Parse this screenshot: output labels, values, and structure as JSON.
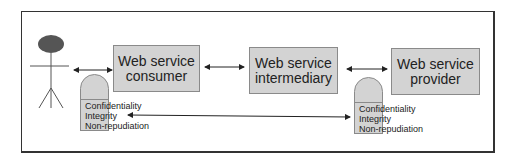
{
  "diagram": {
    "actor": {
      "name": "User"
    },
    "boxes": [
      {
        "id": "consumer",
        "line1": "Web service",
        "line2": "consumer"
      },
      {
        "id": "intermediary",
        "line1": "Web service",
        "line2": "intermediary"
      },
      {
        "id": "provider",
        "line1": "Web service",
        "line2": "provider"
      }
    ],
    "security_left": {
      "items": [
        "Confidentiality",
        "Integrity",
        "Non-repudiation"
      ]
    },
    "security_right": {
      "items": [
        "Confidentiality",
        "Integrity",
        "Non-repudiation"
      ]
    },
    "colors": {
      "box_fill": "#d3d3d3",
      "box_border": "#8a8a8a",
      "actor_head": "#555555",
      "frame": "#333333"
    }
  }
}
